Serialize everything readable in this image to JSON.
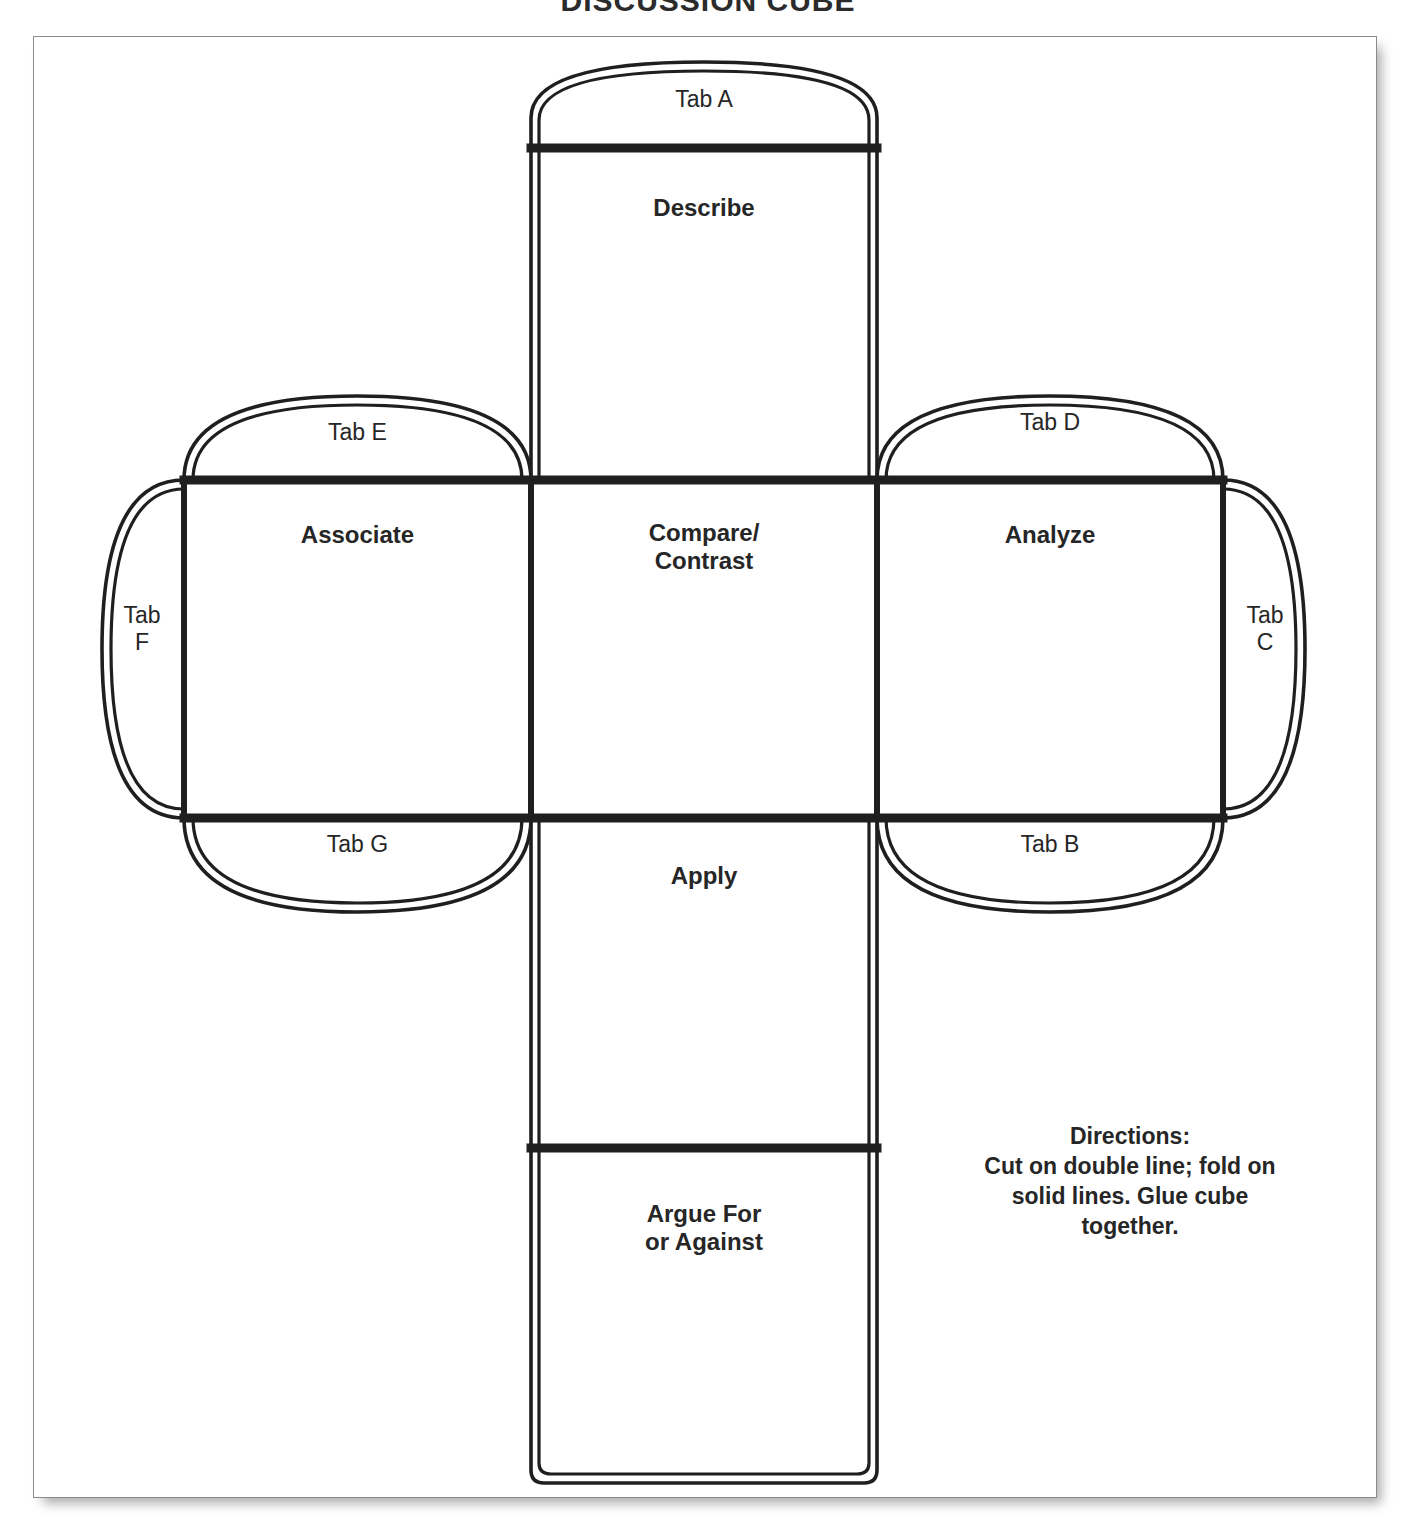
{
  "page": {
    "title": "DISCUSSION CUBE",
    "background_color": "#ffffff",
    "ink_color": "#262626",
    "sheet_border_color": "#8b8b8b"
  },
  "net": {
    "type": "cube-net-template",
    "faces": [
      {
        "id": "describe",
        "label": "Describe",
        "position": "top-of-vertical-strip"
      },
      {
        "id": "compare-contrast",
        "label": "Compare/\nContrast",
        "position": "center"
      },
      {
        "id": "associate",
        "label": "Associate",
        "position": "left"
      },
      {
        "id": "analyze",
        "label": "Analyze",
        "position": "right"
      },
      {
        "id": "apply",
        "label": "Apply",
        "position": "below-center"
      },
      {
        "id": "argue",
        "label": "Argue For\nor Against",
        "position": "bottom-of-vertical-strip"
      }
    ],
    "tabs": [
      {
        "id": "tab-a",
        "label": "Tab A",
        "shape": "dome-up",
        "attached_to": "describe-top"
      },
      {
        "id": "tab-b",
        "label": "Tab B",
        "shape": "dome-down",
        "attached_to": "analyze-bottom"
      },
      {
        "id": "tab-c",
        "label": "Tab\nC",
        "shape": "dome-right",
        "attached_to": "analyze-right"
      },
      {
        "id": "tab-d",
        "label": "Tab D",
        "shape": "dome-up",
        "attached_to": "analyze-top"
      },
      {
        "id": "tab-e",
        "label": "Tab E",
        "shape": "dome-up",
        "attached_to": "associate-top"
      },
      {
        "id": "tab-f",
        "label": "Tab\nF",
        "shape": "dome-left",
        "attached_to": "associate-left"
      },
      {
        "id": "tab-g",
        "label": "Tab G",
        "shape": "dome-down",
        "attached_to": "associate-bottom"
      }
    ]
  },
  "directions": {
    "heading": "Directions:",
    "line1": "Cut on double line; fold on",
    "line2": "solid lines. Glue cube",
    "line3": "together.",
    "full_text": "Directions:\nCut on double line; fold on\nsolid lines. Glue cube\ntogether."
  }
}
